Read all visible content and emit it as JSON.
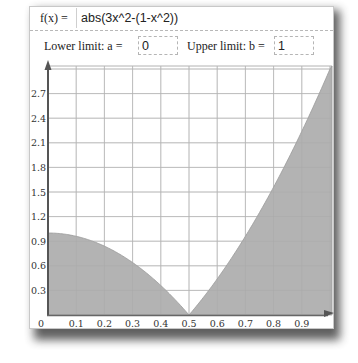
{
  "function_field": {
    "label": "f(x) =",
    "value": "abs(3x^2-(1-x^2))"
  },
  "limits": {
    "lower_label": "Lower limit: a =",
    "lower_value": "0",
    "upper_label": "Upper limit: b =",
    "upper_value": "1"
  },
  "colors": {
    "fill": "#b3b3b3",
    "grid": "#cfcfcf",
    "axis": "#555555"
  },
  "chart_data": {
    "type": "area",
    "title": "",
    "function": "abs(3x^2-(1-x^2))",
    "xlabel": "",
    "ylabel": "",
    "x_ticks": [
      "0",
      "0.1",
      "0.2",
      "0.3",
      "0.4",
      "0.5",
      "0.6",
      "0.7",
      "0.8",
      "0.9"
    ],
    "y_ticks": [
      "0.3",
      "0.6",
      "0.9",
      "1.2",
      "1.5",
      "1.8",
      "2.1",
      "2.4",
      "2.7"
    ],
    "xlim": [
      0,
      1
    ],
    "ylim": [
      0,
      3.0
    ],
    "grid": true,
    "legend": null,
    "shaded_region": {
      "from": 0,
      "to": 1
    },
    "x": [
      0,
      0.1,
      0.2,
      0.3,
      0.4,
      0.5,
      0.6,
      0.7,
      0.8,
      0.9,
      1.0
    ],
    "values": [
      1.0,
      0.96,
      0.84,
      0.64,
      0.36,
      0.0,
      0.44,
      0.96,
      1.56,
      2.24,
      3.0
    ]
  }
}
